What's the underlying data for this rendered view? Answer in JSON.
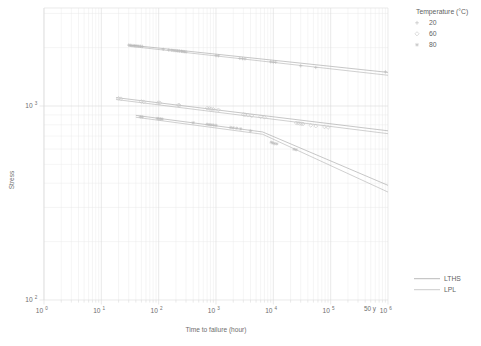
{
  "chart_data": {
    "type": "scatter",
    "title": "",
    "xlabel": "Time to failure (hour)",
    "ylabel": "Stress",
    "xscale": "log",
    "yscale": "log",
    "xlim": [
      1,
      1000000
    ],
    "ylim": [
      100,
      3200
    ],
    "grid": true,
    "x_tick_labels": [
      "10^0",
      "10^1",
      "10^2",
      "10^3",
      "10^4",
      "10^5",
      "10^6"
    ],
    "x_tick_values": [
      1,
      10,
      100,
      1000,
      10000,
      100000,
      1000000
    ],
    "y_tick_labels": [
      "10^2",
      "10^3"
    ],
    "y_tick_values": [
      100,
      1000
    ],
    "annotations": [
      {
        "text": "50 y",
        "x": 438000,
        "y": 100,
        "note": "50 years service life marker on time axis"
      }
    ],
    "legend_position": "outside top-right",
    "series": [
      {
        "name": "20",
        "legend_label": "20",
        "marker": "plus",
        "color": "#b9b9b9",
        "points": [
          [
            30,
            2060
          ],
          [
            32,
            2055
          ],
          [
            34,
            2050
          ],
          [
            36,
            2048
          ],
          [
            38,
            2045
          ],
          [
            40,
            2042
          ],
          [
            42,
            2040
          ],
          [
            45,
            2035
          ],
          [
            48,
            2032
          ],
          [
            52,
            2028
          ],
          [
            120,
            1960
          ],
          [
            150,
            1945
          ],
          [
            170,
            1938
          ],
          [
            185,
            1932
          ],
          [
            200,
            1928
          ],
          [
            215,
            1925
          ],
          [
            230,
            1920
          ],
          [
            250,
            1915
          ],
          [
            265,
            1910
          ],
          [
            280,
            1905
          ],
          [
            300,
            1900
          ],
          [
            1000,
            1820
          ],
          [
            1100,
            1815
          ],
          [
            2600,
            1760
          ],
          [
            2900,
            1755
          ],
          [
            3200,
            1750
          ],
          [
            9000,
            1690
          ],
          [
            10000,
            1685
          ],
          [
            11000,
            1682
          ],
          [
            30000,
            1610
          ],
          [
            55000,
            1580
          ],
          [
            900000,
            1500
          ]
        ]
      },
      {
        "name": "60",
        "legend_label": "60",
        "marker": "diamond",
        "color": "#c6c6c6",
        "points": [
          [
            20,
            1095
          ],
          [
            22,
            1090
          ],
          [
            50,
            1055
          ],
          [
            55,
            1050
          ],
          [
            98,
            1040
          ],
          [
            105,
            1038
          ],
          [
            220,
            1010
          ],
          [
            230,
            1008
          ],
          [
            700,
            975
          ],
          [
            760,
            972
          ],
          [
            820,
            968
          ],
          [
            900,
            962
          ],
          [
            1100,
            955
          ],
          [
            3000,
            905
          ],
          [
            3200,
            902
          ],
          [
            3600,
            898
          ],
          [
            4200,
            890
          ],
          [
            6000,
            880
          ],
          [
            7000,
            875
          ],
          [
            25000,
            818
          ],
          [
            27000,
            815
          ],
          [
            29000,
            812
          ],
          [
            31000,
            810
          ],
          [
            33000,
            808
          ],
          [
            45000,
            795
          ],
          [
            55000,
            788
          ],
          [
            78000,
            780
          ],
          [
            90000,
            775
          ]
        ]
      },
      {
        "name": "80",
        "legend_label": "80",
        "marker": "star",
        "color": "#bdbdbd",
        "points": [
          [
            48,
            880
          ],
          [
            52,
            878
          ],
          [
            95,
            862
          ],
          [
            100,
            860
          ],
          [
            108,
            858
          ],
          [
            115,
            856
          ],
          [
            400,
            820
          ],
          [
            700,
            805
          ],
          [
            760,
            802
          ],
          [
            820,
            800
          ],
          [
            900,
            798
          ],
          [
            1000,
            795
          ],
          [
            1800,
            775
          ],
          [
            2000,
            772
          ],
          [
            2300,
            768
          ],
          [
            2700,
            762
          ],
          [
            4000,
            745
          ],
          [
            9200,
            650
          ],
          [
            9800,
            645
          ],
          [
            10500,
            640
          ],
          [
            11500,
            638
          ],
          [
            23000,
            598
          ],
          [
            25000,
            595
          ]
        ]
      }
    ],
    "fit_lines": [
      {
        "name": "LTHS",
        "series": "20",
        "points": [
          [
            30,
            2065
          ],
          [
            1000000,
            1490
          ]
        ]
      },
      {
        "name": "LPL",
        "series": "20",
        "points": [
          [
            30,
            2035
          ],
          [
            1000000,
            1440
          ]
        ]
      },
      {
        "name": "LTHS",
        "series": "60",
        "points": [
          [
            18,
            1105
          ],
          [
            1000000,
            745
          ]
        ]
      },
      {
        "name": "LPL",
        "series": "60",
        "points": [
          [
            18,
            1080
          ],
          [
            1000000,
            720
          ]
        ]
      },
      {
        "name": "LTHS",
        "series": "80",
        "points": [
          [
            40,
            895
          ],
          [
            6500,
            735
          ],
          [
            1000000,
            390
          ]
        ]
      },
      {
        "name": "LPL",
        "series": "80",
        "points": [
          [
            40,
            875
          ],
          [
            6500,
            715
          ],
          [
            1000000,
            360
          ]
        ]
      }
    ]
  },
  "legend": {
    "temperature_title": "Temperature (°C)",
    "items": [
      {
        "label": "20",
        "marker": "plus"
      },
      {
        "label": "60",
        "marker": "diamond"
      },
      {
        "label": "80",
        "marker": "star"
      }
    ],
    "lines": [
      {
        "label": "LTHS"
      },
      {
        "label": "LPL"
      }
    ]
  },
  "axes": {
    "x_title": "Time to failure (hour)",
    "y_title": "Stress",
    "x_ticks": [
      {
        "base": "10",
        "exp": "0"
      },
      {
        "base": "10",
        "exp": "1"
      },
      {
        "base": "10",
        "exp": "2"
      },
      {
        "base": "10",
        "exp": "3"
      },
      {
        "base": "10",
        "exp": "4"
      },
      {
        "base": "10",
        "exp": "5"
      },
      {
        "base": "10",
        "exp": "6"
      }
    ],
    "y_ticks": [
      {
        "base": "10",
        "exp": "3"
      },
      {
        "base": "10",
        "exp": "2"
      }
    ],
    "annotation_50y": "50 y"
  },
  "colors": {
    "grid": "#dcdcdc",
    "grid_minor": "#e8e8e8",
    "line": "#a8a8a8",
    "marker": "#c0c0c0",
    "text": "#6e6e6e"
  }
}
